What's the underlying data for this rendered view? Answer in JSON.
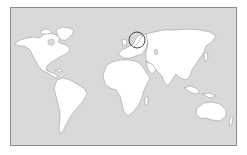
{
  "map": {
    "type": "world-outline-map",
    "projection": "equirectangular-like",
    "colors": {
      "ocean": "#d9d9d9",
      "land": "#ffffff",
      "coastline": "#8c8c8c",
      "frame": "#8a8a8a",
      "highlight_circle": "#333333"
    },
    "regions": [
      {
        "name": "North America"
      },
      {
        "name": "Greenland"
      },
      {
        "name": "South America"
      },
      {
        "name": "Europe"
      },
      {
        "name": "Africa"
      },
      {
        "name": "Asia"
      },
      {
        "name": "Australia"
      }
    ],
    "highlight": {
      "region": "Scandinavia",
      "shape": "circle"
    }
  }
}
